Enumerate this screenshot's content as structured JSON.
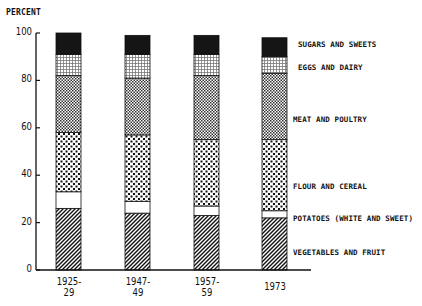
{
  "chart_data": {
    "type": "bar",
    "stacked": true,
    "title": "",
    "ylabel": "PERCENT",
    "xlabel": "",
    "ylim": [
      0,
      100
    ],
    "yticks": [
      0,
      20,
      40,
      60,
      80,
      100
    ],
    "grid": false,
    "legend_position": "right (labels aligned to last bar segments)",
    "categories": [
      "1925-\n29",
      "1947-\n49",
      "1957-\n59",
      "1973"
    ],
    "category_lines": [
      [
        "1925-",
        "29"
      ],
      [
        "1947-",
        "49"
      ],
      [
        "1957-",
        "59"
      ],
      [
        "1973",
        ""
      ]
    ],
    "series": [
      {
        "name": "VEGETABLES AND FRUIT",
        "pattern": "diagonal-hatch",
        "values": [
          26,
          24,
          23,
          22
        ]
      },
      {
        "name": "POTATOES (WHITE AND SWEET)",
        "pattern": "blank",
        "values": [
          7,
          5,
          4,
          3
        ]
      },
      {
        "name": "FLOUR AND CEREAL",
        "pattern": "coarse-dots",
        "values": [
          25,
          28,
          28,
          30
        ]
      },
      {
        "name": "MEAT AND POULTRY",
        "pattern": "checkered",
        "values": [
          24,
          24,
          27,
          28
        ]
      },
      {
        "name": "EGGS AND DAIRY",
        "pattern": "fine-grid",
        "values": [
          9,
          10,
          9,
          7
        ]
      },
      {
        "name": "SUGARS AND SWEETS",
        "pattern": "solid-black",
        "values": [
          9,
          8,
          8,
          8
        ]
      }
    ]
  },
  "axis": {
    "y_label": "PERCENT",
    "ticks": [
      "0",
      "20",
      "40",
      "60",
      "80",
      "100"
    ]
  },
  "legend": {
    "sugars": "SUGARS AND SWEETS",
    "eggs": "EGGS AND DAIRY",
    "meat": "MEAT AND POULTRY",
    "flour": "FLOUR AND CEREAL",
    "potatoes": "POTATOES (WHITE AND SWEET)",
    "vegetables": "VEGETABLES AND FRUIT"
  },
  "x_labels": [
    {
      "line1": "1925-",
      "line2": "29"
    },
    {
      "line1": "1947-",
      "line2": "49"
    },
    {
      "line1": "1957-",
      "line2": "59"
    },
    {
      "line1": "1973",
      "line2": ""
    }
  ]
}
